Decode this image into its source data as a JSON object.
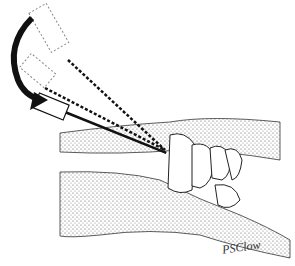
{
  "illustration": {
    "subject": "needle injection into wrist joint with syringe angle change",
    "signature": "PSClow"
  }
}
